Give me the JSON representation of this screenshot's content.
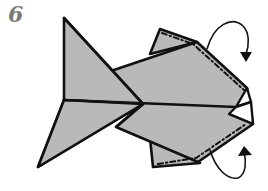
{
  "step": {
    "number": "6"
  },
  "diagram": {
    "colors": {
      "paper": "#b9b9b9",
      "outline": "#111111",
      "background": "#ffffff",
      "step_number": "#7a7a7a"
    },
    "annotations": [
      {
        "type": "mountain-fold-line",
        "location": "top fin edge"
      },
      {
        "type": "mountain-fold-line",
        "location": "bottom fin edge"
      },
      {
        "type": "curved-arrow",
        "location": "top right",
        "direction": "fold behind"
      },
      {
        "type": "curved-arrow",
        "location": "bottom right",
        "direction": "fold behind"
      }
    ]
  }
}
